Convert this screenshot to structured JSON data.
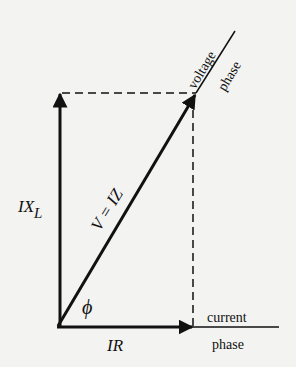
{
  "diagram": {
    "type": "phasor-diagram",
    "colors": {
      "background": "#f3f3f2",
      "ink": "#111111"
    },
    "origin": {
      "x": 57,
      "y": 327
    },
    "vectors": [
      {
        "id": "IR",
        "label": "IR",
        "direction": "horizontal",
        "from": [
          57,
          327
        ],
        "to": [
          193,
          327
        ]
      },
      {
        "id": "IXL",
        "label_main": "IX",
        "label_sub": "L",
        "direction": "vertical",
        "from": [
          60,
          327
        ],
        "to": [
          60,
          92
        ]
      },
      {
        "id": "V",
        "label": "V = IZ",
        "direction": "diagonal",
        "from": [
          57,
          327
        ],
        "to": [
          196,
          93
        ]
      }
    ],
    "angle_label": "ϕ",
    "axes": {
      "current": {
        "line1": "current",
        "line2": "phase"
      },
      "voltage": {
        "line1": "voltage",
        "line2": "phase"
      }
    },
    "projections": [
      "horizontal dashed from IX_L tip to V tip",
      "vertical dashed from V tip to IR axis"
    ]
  }
}
